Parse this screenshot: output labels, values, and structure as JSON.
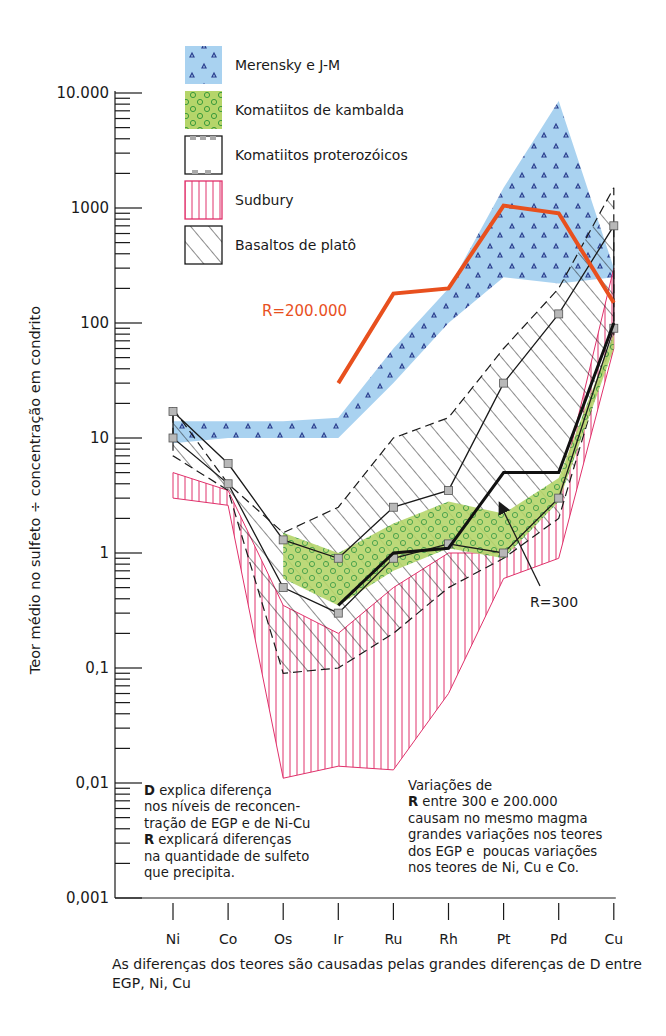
{
  "chart_data": {
    "type": "area",
    "title": "",
    "xlabel": "As diferenças dos teores são causadas pelas grandes diferenças de D entre EGP, Ni, Cu",
    "ylabel": "Teor médio no sulfeto ÷ concentração em condrito",
    "yscale": "log",
    "ylim": [
      0.001,
      10000
    ],
    "yticks": [
      {
        "value": 10000,
        "label": "10.000"
      },
      {
        "value": 1000,
        "label": "1000"
      },
      {
        "value": 100,
        "label": "100"
      },
      {
        "value": 10,
        "label": "10"
      },
      {
        "value": 1,
        "label": "1"
      },
      {
        "value": 0.1,
        "label": "0,1"
      },
      {
        "value": 0.01,
        "label": "0,01"
      },
      {
        "value": 0.001,
        "label": "0,001"
      }
    ],
    "categories": [
      "Ni",
      "Co",
      "Os",
      "Ir",
      "Ru",
      "Rh",
      "Pt",
      "Pd",
      "Cu"
    ],
    "grid": false,
    "legend_position": "top-left inside",
    "series": [
      {
        "name": "Merensky e J-M",
        "kind": "band",
        "color": "#a9d2f0",
        "pattern": "triangles",
        "pattern_color": "#2b3f8f",
        "upper": [
          14,
          14,
          14,
          15,
          60,
          200,
          1500,
          8500,
          300
        ],
        "lower": [
          9,
          10,
          10,
          10,
          30,
          100,
          250,
          220,
          250
        ]
      },
      {
        "name": "Komatiitos de kambalda",
        "kind": "band",
        "color": "#b5d56a",
        "pattern": "dots",
        "pattern_color": "#2e8b2e",
        "x_range": [
          "Os",
          "Cu"
        ],
        "upper": [
          null,
          null,
          1.5,
          1.0,
          1.8,
          2.8,
          2.2,
          4.5,
          80
        ],
        "lower": [
          null,
          null,
          0.6,
          0.35,
          0.7,
          1.1,
          0.9,
          2.8,
          60
        ]
      },
      {
        "name": "Komatiitos proterozóicos",
        "kind": "band",
        "color": "#ffffff",
        "pattern": "square-markers",
        "pattern_color": "#9a9a9a",
        "upper": [
          17,
          6,
          1.3,
          0.9,
          2.5,
          3.5,
          30,
          120,
          700
        ],
        "lower": [
          10,
          4,
          0.5,
          0.3,
          0.9,
          1.2,
          1.0,
          3,
          90
        ]
      },
      {
        "name": "Sudbury",
        "kind": "band",
        "color": "#e0316b",
        "pattern": "vertical-lines",
        "upper": [
          5,
          3.5,
          0.35,
          0.2,
          0.5,
          1.0,
          1.0,
          3,
          300
        ],
        "lower": [
          3,
          2.6,
          0.011,
          0.014,
          0.013,
          0.06,
          0.6,
          0.9,
          60
        ]
      },
      {
        "name": "Basaltos de platô",
        "kind": "band",
        "color": "#1a1a1a",
        "pattern": "diagonal-hatch",
        "upper": [
          18,
          4,
          1.5,
          2.5,
          10,
          15,
          60,
          200,
          1500
        ],
        "lower": [
          7,
          3.5,
          0.09,
          0.1,
          0.2,
          0.5,
          0.9,
          2,
          80
        ]
      },
      {
        "name": "R=200.000",
        "kind": "line",
        "color": "#e8501e",
        "values": [
          null,
          null,
          null,
          30,
          180,
          200,
          1050,
          900,
          150
        ]
      },
      {
        "name": "R=300",
        "kind": "line",
        "color": "#111111",
        "values": [
          null,
          null,
          null,
          0.35,
          1.0,
          1.1,
          5,
          5,
          100
        ]
      }
    ],
    "annotations": [
      {
        "text": "R=200.000",
        "color": "#e8501e",
        "anchor_category": "Ir",
        "value": 110
      },
      {
        "text": "R=300",
        "color": "#1a1a1a",
        "anchor_category": "Pd",
        "value": 0.2,
        "arrow_to": {
          "category": "Pt",
          "value": 2.2
        }
      }
    ]
  },
  "legend": {
    "items": [
      {
        "label": "Merensky e J-M"
      },
      {
        "label": "Komatiitos de kambalda"
      },
      {
        "label": "Komatiitos proterozóicos"
      },
      {
        "label": "Sudbury"
      },
      {
        "label": "Basaltos de platô"
      }
    ]
  },
  "notes": {
    "left": {
      "lines": [
        {
          "bold": "D",
          "text": " explica diferença"
        },
        {
          "bold": "",
          "text": "nos níveis de reconcen-"
        },
        {
          "bold": "",
          "text": "tração de EGP e de Ni-Cu"
        },
        {
          "bold": "R",
          "text": " explicará diferenças"
        },
        {
          "bold": "",
          "text": "na quantidade de sulfeto"
        },
        {
          "bold": "",
          "text": "que precipita."
        }
      ]
    },
    "right": {
      "lines": [
        {
          "bold": "",
          "text": "Variações de"
        },
        {
          "bold": "R",
          "text": " entre 300 e 200.000"
        },
        {
          "bold": "",
          "text": "causam no mesmo magma"
        },
        {
          "bold": "",
          "text": "grandes variações nos teores"
        },
        {
          "bold": "",
          "text": "dos EGP e  poucas variações"
        },
        {
          "bold": "",
          "text": "nos teores de Ni, Cu e Co."
        }
      ]
    }
  },
  "labels": {
    "ytitle": "Teor médio no sulfeto ÷ concentração em condrito",
    "caption": "As diferenças dos teores são causadas pelas grandes diferenças de D entre EGP, Ni, Cu",
    "r200000": "R=200.000",
    "r300": "R=300"
  }
}
